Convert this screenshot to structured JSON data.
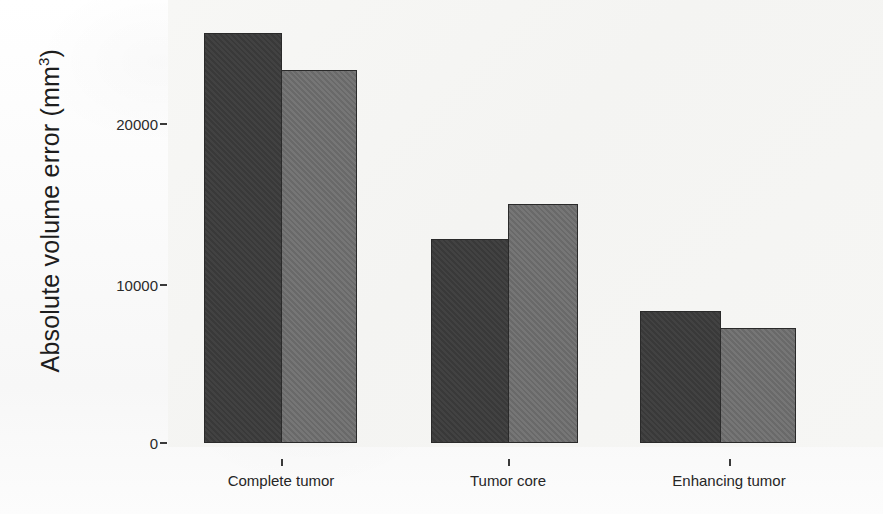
{
  "chart_data": {
    "type": "bar",
    "title": "",
    "xlabel": "",
    "ylabel": "Absolute volume error (mm3)",
    "ylabel_base": "Absolute volume error  (mm",
    "ylabel_sup": "3",
    "ylabel_close": ")",
    "categories": [
      "Complete tumor",
      "Tumor core",
      "Enhancing tumor"
    ],
    "series": [
      {
        "name": "dark",
        "color": "#3b3b3b",
        "values": [
          25700,
          12800,
          8300
        ]
      },
      {
        "name": "light",
        "color": "#6f6f6f",
        "values": [
          23400,
          15000,
          7200
        ]
      }
    ],
    "ylim": [
      0,
      26500
    ],
    "yticks": [
      0,
      10000,
      20000
    ],
    "ytick_labels": [
      "0",
      "10000",
      "20000"
    ],
    "grid": false,
    "legend": "none"
  },
  "axes": {
    "y_tick_0": "0",
    "y_tick_1": "10000",
    "y_tick_2": "20000",
    "x_tick_0": "Complete tumor",
    "x_tick_1": "Tumor core",
    "x_tick_2": "Enhancing tumor"
  },
  "colors": {
    "bar_dark": "#3b3b3b",
    "bar_light": "#6f6f6f",
    "axis": "#2a2a2a",
    "background": "#f6f6f4"
  }
}
